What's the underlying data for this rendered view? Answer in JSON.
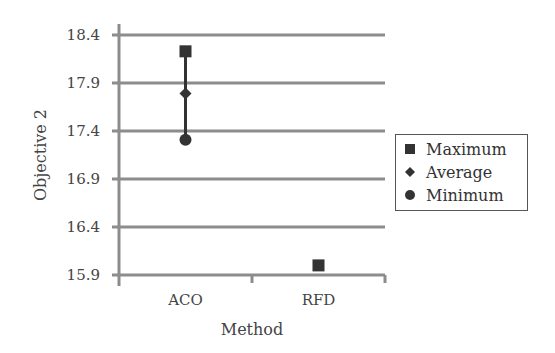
{
  "chart_data": {
    "type": "scatter",
    "title": "",
    "xlabel": "Method",
    "ylabel": "Objective 2",
    "categories": [
      "ACO",
      "RFD"
    ],
    "yticks": [
      "15.9",
      "16.4",
      "16.9",
      "17.4",
      "17.9",
      "18.4"
    ],
    "ylim": [
      15.9,
      18.4
    ],
    "grid": true,
    "legend_position": "right",
    "series": [
      {
        "name": "Maximum",
        "marker": "square",
        "values": [
          18.23,
          16.0
        ]
      },
      {
        "name": "Average",
        "marker": "diamond",
        "values": [
          17.79,
          null
        ]
      },
      {
        "name": "Minimum",
        "marker": "circle",
        "values": [
          17.31,
          null
        ]
      }
    ],
    "colors": {
      "marker": "#333333",
      "grid": "#8c8c8c",
      "axis": "#8c8c8c"
    }
  },
  "legend": {
    "items": [
      {
        "label": "Maximum"
      },
      {
        "label": "Average"
      },
      {
        "label": "Minimum"
      }
    ]
  }
}
